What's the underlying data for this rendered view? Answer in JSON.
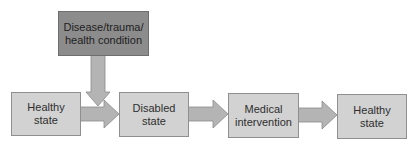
{
  "diagram": {
    "type": "flowchart",
    "colors": {
      "box_fill": "#d2d2d2",
      "cause_box_fill": "#8c8c8c",
      "arrow_fill": "#b4b4b4",
      "border": "#8f8f8f"
    },
    "cause": {
      "line1": "Disease/trauma/",
      "line2": "health condition"
    },
    "nodes": [
      {
        "id": "healthy-1",
        "line1": "Healthy",
        "line2": "state"
      },
      {
        "id": "disabled",
        "line1": "Disabled",
        "line2": "state"
      },
      {
        "id": "medical",
        "line1": "Medical",
        "line2": "intervention"
      },
      {
        "id": "healthy-2",
        "line1": "Healthy",
        "line2": "state"
      }
    ],
    "edges": [
      {
        "from": "cause",
        "to": "healthy-1->disabled arrow",
        "direction": "down"
      },
      {
        "from": "healthy-1",
        "to": "disabled"
      },
      {
        "from": "disabled",
        "to": "medical"
      },
      {
        "from": "medical",
        "to": "healthy-2"
      }
    ]
  }
}
